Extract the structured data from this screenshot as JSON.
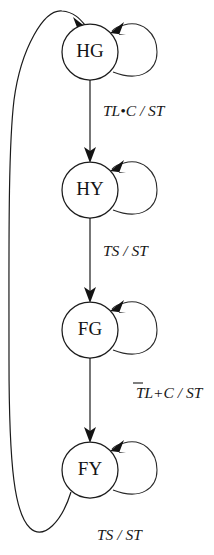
{
  "diagram": {
    "type": "state-machine",
    "background_color": "#ffffff",
    "line_color": "#1b1b1b",
    "text_color": "#141414",
    "states": [
      {
        "id": "HG",
        "label": "HG",
        "cx": 90,
        "cy": 52,
        "r": 28
      },
      {
        "id": "HY",
        "label": "HY",
        "cx": 90,
        "cy": 190,
        "r": 28
      },
      {
        "id": "FG",
        "label": "FG",
        "cx": 90,
        "cy": 330,
        "r": 28
      },
      {
        "id": "FY",
        "label": "FY",
        "cx": 90,
        "cy": 470,
        "r": 28
      }
    ],
    "transitions": [
      {
        "from": "HG",
        "to": "HY",
        "kind": "straight-down",
        "label_parts": [
          {
            "text": "TL",
            "overbar": false
          },
          {
            "text": "•",
            "overbar": false
          },
          {
            "text": "C",
            "overbar": false
          },
          {
            "text": " / ST",
            "overbar": false
          }
        ],
        "label_plain": "TL•C / ST",
        "label_x": 103,
        "label_y": 112
      },
      {
        "from": "HY",
        "to": "FG",
        "kind": "straight-down",
        "label_parts": [
          {
            "text": "TS / ST",
            "overbar": false
          }
        ],
        "label_plain": "TS / ST",
        "label_x": 103,
        "label_y": 252
      },
      {
        "from": "FG",
        "to": "FY",
        "kind": "straight-down",
        "label_parts": [
          {
            "text": "TL+",
            "overbar": false
          },
          {
            "text": "C",
            "overbar": true
          },
          {
            "text": " / ST",
            "overbar": false
          }
        ],
        "label_plain": "TL+C̄ / ST",
        "label_x": 101,
        "label_y": 394
      },
      {
        "from": "FY",
        "to": "HG",
        "kind": "feedback-left",
        "label_parts": [
          {
            "text": "TS / ST",
            "overbar": false
          }
        ],
        "label_plain": "TS / ST",
        "label_x": 97,
        "label_y": 536
      }
    ],
    "self_loops": [
      {
        "state": "HG",
        "label": ""
      },
      {
        "state": "HY",
        "label": ""
      },
      {
        "state": "FG",
        "label": ""
      },
      {
        "state": "FY",
        "label": ""
      }
    ]
  }
}
